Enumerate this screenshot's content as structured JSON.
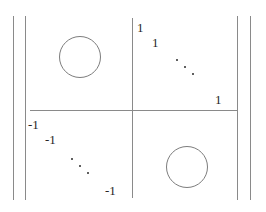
{
  "figure": {
    "kind": "block-matrix",
    "delimiter": "double-vertical-bar",
    "colors": {
      "rule": "#8a8a8a",
      "glyph": "#262626",
      "circle": "#7d7d7d",
      "background": "#ffffff"
    }
  },
  "blocks": {
    "top_left": {
      "label": "0",
      "render": "circle"
    },
    "top_right": {
      "label": "identity-diagonal",
      "entries": [
        {
          "value": "1",
          "x": 137,
          "y": 21
        },
        {
          "value": "1",
          "x": 152,
          "y": 36
        },
        {
          "value": "1",
          "x": 215,
          "y": 93
        }
      ],
      "ellipsis": {
        "x": 175,
        "y": 58
      }
    },
    "bottom_left": {
      "label": "negative-identity-diagonal",
      "entries": [
        {
          "value": "-1",
          "x": 28,
          "y": 118
        },
        {
          "value": "-1",
          "x": 45,
          "y": 133
        },
        {
          "value": "-1",
          "x": 105,
          "y": 184
        }
      ],
      "ellipsis": {
        "x": 70,
        "y": 157
      }
    },
    "bottom_right": {
      "label": "0",
      "render": "circle"
    }
  },
  "delimiters": {
    "left_outer": {
      "x": 13,
      "y": 16,
      "height": 184
    },
    "left_inner": {
      "x": 25,
      "y": 16,
      "height": 184
    },
    "right_inner": {
      "x": 237,
      "y": 16,
      "height": 184
    },
    "right_outer": {
      "x": 250,
      "y": 16,
      "height": 184
    }
  },
  "partitions": {
    "vertical": {
      "x": 132,
      "y": 18,
      "height": 180
    },
    "horizontal": {
      "x": 30,
      "y": 110,
      "width": 207
    }
  },
  "circles": {
    "upper": {
      "x": 59,
      "y": 36,
      "size": 42
    },
    "lower": {
      "x": 166,
      "y": 146,
      "size": 42
    }
  }
}
